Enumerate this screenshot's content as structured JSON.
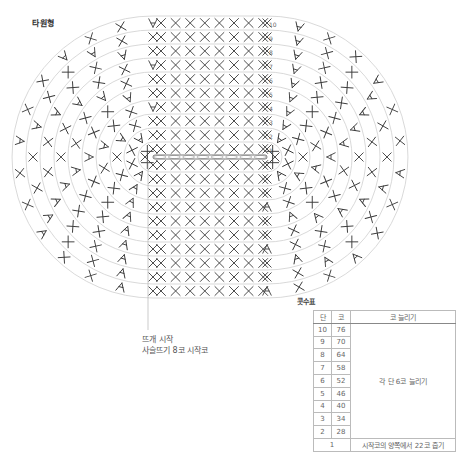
{
  "title": "타원형",
  "start_note": {
    "line1": "뜨개 시작",
    "line2": "사슬뜨기 8코 시작코"
  },
  "table": {
    "title": "콧수표",
    "headers": {
      "round": "단",
      "stitches": "코",
      "increase": "코 늘리기"
    },
    "rows": [
      {
        "round": "10",
        "stitches": "76"
      },
      {
        "round": "9",
        "stitches": "70"
      },
      {
        "round": "8",
        "stitches": "64"
      },
      {
        "round": "7",
        "stitches": "58"
      },
      {
        "round": "6",
        "stitches": "52"
      },
      {
        "round": "5",
        "stitches": "46"
      },
      {
        "round": "4",
        "stitches": "40"
      },
      {
        "round": "3",
        "stitches": "34"
      },
      {
        "round": "2",
        "stitches": "28"
      }
    ],
    "increase_note": "각 단 6코 늘리기",
    "first_round": {
      "round": "1",
      "note": "시작코의 양쪽에서 22코 줍기"
    }
  },
  "chart": {
    "round_labels": [
      "1",
      "2",
      "3",
      "4",
      "5",
      "6",
      "7",
      "8",
      "9",
      "10"
    ],
    "start_chain_count": 8,
    "colors": {
      "stitch": "#3a3a3a",
      "guide": "#c8c8c8",
      "chain": "#555555"
    }
  }
}
